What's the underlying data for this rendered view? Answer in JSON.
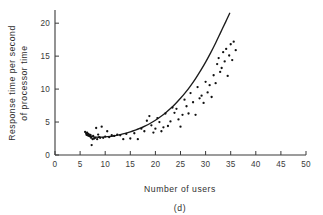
{
  "chart_data": {
    "type": "scatter",
    "title": "",
    "subtitle": "",
    "caption": "(d)",
    "xlabel": "Number of users",
    "ylabel_line1": "Response time per second",
    "ylabel_line2": "of processor time",
    "ylabel": "Response time per second of processor time",
    "xlim": [
      0,
      50
    ],
    "ylim": [
      0,
      22
    ],
    "xticks": [
      0,
      5,
      10,
      15,
      20,
      25,
      30,
      35,
      40,
      45,
      50
    ],
    "xticklabels": [
      "0",
      "5",
      "10",
      "15",
      "20",
      "25",
      "30",
      "35",
      "40",
      "45",
      "50"
    ],
    "yticks": [
      0,
      5,
      10,
      15,
      20
    ],
    "yticklabels": [
      "0",
      "5",
      "10",
      "15",
      "20"
    ],
    "grid": false,
    "legend": false,
    "legend_position": "none",
    "marker": "dot",
    "marker_color": "#111111",
    "curve_color": "#1c1c1c",
    "axis_color": "#3a3a3a",
    "background": "#ffffff",
    "series": [
      {
        "name": "Observations",
        "points": [
          [
            6.0,
            3.5
          ],
          [
            6.2,
            3.3
          ],
          [
            6.3,
            3.1
          ],
          [
            6.4,
            3.4
          ],
          [
            6.5,
            3.0
          ],
          [
            6.6,
            3.2
          ],
          [
            6.8,
            2.9
          ],
          [
            6.9,
            3.1
          ],
          [
            7.0,
            2.8
          ],
          [
            7.1,
            3.0
          ],
          [
            7.2,
            2.6
          ],
          [
            7.3,
            1.5
          ],
          [
            7.5,
            2.4
          ],
          [
            7.6,
            2.9
          ],
          [
            7.8,
            2.5
          ],
          [
            8.0,
            2.6
          ],
          [
            8.2,
            4.1
          ],
          [
            8.4,
            2.4
          ],
          [
            8.6,
            3.1
          ],
          [
            8.8,
            2.7
          ],
          [
            9.0,
            2.6
          ],
          [
            9.3,
            4.3
          ],
          [
            9.6,
            2.6
          ],
          [
            10.0,
            2.8
          ],
          [
            10.4,
            3.6
          ],
          [
            10.8,
            2.7
          ],
          [
            11.3,
            3.0
          ],
          [
            11.8,
            2.9
          ],
          [
            12.4,
            3.1
          ],
          [
            13.0,
            3.0
          ],
          [
            13.6,
            2.4
          ],
          [
            14.2,
            3.2
          ],
          [
            15.0,
            2.5
          ],
          [
            15.8,
            3.3
          ],
          [
            16.5,
            2.4
          ],
          [
            17.2,
            4.0
          ],
          [
            17.8,
            3.6
          ],
          [
            18.3,
            5.2
          ],
          [
            18.8,
            5.9
          ],
          [
            19.2,
            4.5
          ],
          [
            19.6,
            3.4
          ],
          [
            20.0,
            4.0
          ],
          [
            20.4,
            5.6
          ],
          [
            20.8,
            5.0
          ],
          [
            21.2,
            3.6
          ],
          [
            21.6,
            4.2
          ],
          [
            22.0,
            6.3
          ],
          [
            22.5,
            4.4
          ],
          [
            23.0,
            5.1
          ],
          [
            23.4,
            7.2
          ],
          [
            23.8,
            6.4
          ],
          [
            24.2,
            7.0
          ],
          [
            24.6,
            5.4
          ],
          [
            25.0,
            4.3
          ],
          [
            25.4,
            6.1
          ],
          [
            25.8,
            8.4
          ],
          [
            26.2,
            7.4
          ],
          [
            26.6,
            6.3
          ],
          [
            27.0,
            9.4
          ],
          [
            27.5,
            8.0
          ],
          [
            28.0,
            6.1
          ],
          [
            28.4,
            10.3
          ],
          [
            28.8,
            8.6
          ],
          [
            29.2,
            9.0
          ],
          [
            29.6,
            7.9
          ],
          [
            30.0,
            11.1
          ],
          [
            30.4,
            9.5
          ],
          [
            30.8,
            10.6
          ],
          [
            31.2,
            8.8
          ],
          [
            31.6,
            12.1
          ],
          [
            32.0,
            10.9
          ],
          [
            32.3,
            13.8
          ],
          [
            32.6,
            14.7
          ],
          [
            32.9,
            12.6
          ],
          [
            33.2,
            13.2
          ],
          [
            33.5,
            15.6
          ],
          [
            33.8,
            14.2
          ],
          [
            34.1,
            16.1
          ],
          [
            34.4,
            12.0
          ],
          [
            34.7,
            15.1
          ],
          [
            35.0,
            16.8
          ],
          [
            35.3,
            14.4
          ],
          [
            35.6,
            17.2
          ],
          [
            36.0,
            15.9
          ]
        ]
      }
    ],
    "fit_curve": {
      "name": "Fitted trend",
      "points": [
        [
          6.2,
          3.05
        ],
        [
          7.0,
          2.82
        ],
        [
          8.0,
          2.72
        ],
        [
          9.0,
          2.7
        ],
        [
          10.0,
          2.74
        ],
        [
          11.0,
          2.82
        ],
        [
          12.0,
          2.95
        ],
        [
          13.0,
          3.1
        ],
        [
          14.0,
          3.28
        ],
        [
          15.0,
          3.5
        ],
        [
          16.0,
          3.76
        ],
        [
          17.0,
          4.06
        ],
        [
          18.0,
          4.42
        ],
        [
          19.0,
          4.82
        ],
        [
          20.0,
          5.28
        ],
        [
          21.0,
          5.8
        ],
        [
          22.0,
          6.38
        ],
        [
          23.0,
          7.04
        ],
        [
          24.0,
          7.78
        ],
        [
          25.0,
          8.6
        ],
        [
          26.0,
          9.5
        ],
        [
          27.0,
          10.5
        ],
        [
          28.0,
          11.6
        ],
        [
          29.0,
          12.8
        ],
        [
          30.0,
          14.1
        ],
        [
          31.0,
          15.5
        ],
        [
          32.0,
          17.0
        ],
        [
          33.0,
          18.6
        ],
        [
          34.0,
          20.2
        ],
        [
          34.8,
          21.5
        ]
      ]
    }
  }
}
